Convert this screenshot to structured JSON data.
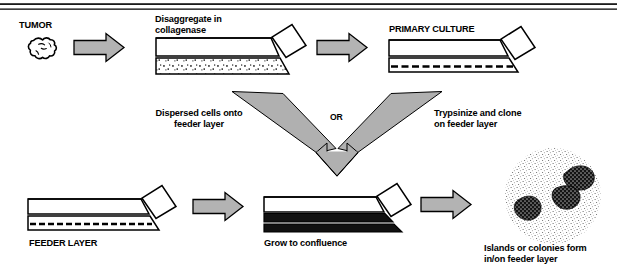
{
  "figure": {
    "domain": "diagram",
    "type": "flow-diagram",
    "title_text": "",
    "background_color": "#ffffff",
    "line_color": "#000000",
    "arrow_fill_color": "#b3b3b3",
    "arrow_stroke_color": "#000000",
    "colony_color": "#1a1a1a"
  },
  "rules": {
    "top_rule_1": "",
    "top_rule_2": ""
  },
  "labels": {
    "tumor": "TUMOR",
    "disaggregate": "Disaggregate in\ncollagenase",
    "primary_culture": "PRIMARY CULTURE",
    "dispersed_cells": "Dispersed cells onto\nfeeder layer",
    "or": "OR",
    "trypsinize": "Trypsinize and clone\non feeder layer",
    "feeder_layer": "FEEDER LAYER",
    "grow_to_confluence": "Grow to confluence",
    "islands_colonies": "Islands or colonies form\nin/on feeder layer"
  },
  "icons": {
    "tumor": "tumor-blob-icon",
    "arrow_right": "arrow-right-icon",
    "arrow_v_merge": "arrow-v-merge-down-icon",
    "flask": "culture-flask-icon",
    "colony_dish": "colony-dish-icon"
  },
  "steps": [
    {
      "id": "tumor",
      "label": "TUMOR",
      "icon": "tumor-blob-icon"
    },
    {
      "id": "disaggregate",
      "label": "Disaggregate in collagenase",
      "icon": "culture-flask-icon",
      "flask_style": "dotted-cells"
    },
    {
      "id": "primary-culture",
      "label": "PRIMARY CULTURE",
      "icon": "culture-flask-icon",
      "flask_style": "dashed-monolayer"
    },
    {
      "id": "feeder-layer",
      "label": "FEEDER LAYER",
      "icon": "culture-flask-icon",
      "flask_style": "dashed-feeder"
    },
    {
      "id": "grow-to-confluence",
      "label": "Grow to confluence",
      "icon": "culture-flask-icon",
      "flask_style": "solid-confluent"
    },
    {
      "id": "islands-colonies",
      "label": "Islands or colonies form in/on feeder layer",
      "icon": "colony-dish-icon",
      "colony_count": 3
    }
  ],
  "connectors": [
    {
      "id": "tumor-to-disaggregate",
      "type": "arrow-right"
    },
    {
      "id": "disaggregate-to-primary",
      "type": "arrow-right"
    },
    {
      "id": "merge-to-feeder",
      "type": "arrow-v-merge-down",
      "branch_left_label": "Dispersed cells onto feeder layer",
      "branch_right_label": "Trypsinize and clone on feeder layer",
      "center_label": "OR"
    },
    {
      "id": "feeder-to-grow",
      "type": "arrow-right"
    },
    {
      "id": "grow-to-islands",
      "type": "arrow-right"
    }
  ]
}
